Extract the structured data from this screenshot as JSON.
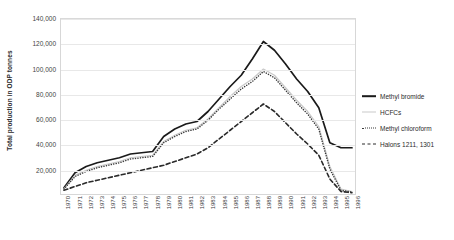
{
  "chart_data": {
    "type": "line",
    "title": "",
    "xlabel": "",
    "ylabel": "Total production in ODP tonnes",
    "ylim": [
      0,
      140000
    ],
    "ytick_labels": [
      "140,000",
      "120,000",
      "100,000",
      "80,000",
      "60,000",
      "40,000",
      "20,000"
    ],
    "ytick_values": [
      140000,
      120000,
      100000,
      80000,
      60000,
      40000,
      20000
    ],
    "grid": true,
    "legend_position": "right",
    "x": [
      1970,
      1971,
      1972,
      1973,
      1974,
      1975,
      1976,
      1977,
      1978,
      1979,
      1980,
      1981,
      1982,
      1983,
      1984,
      1985,
      1986,
      1987,
      1988,
      1989,
      1990,
      1991,
      1992,
      1993,
      1994,
      1995,
      1996
    ],
    "xtick_labels": [
      "1970",
      "1971",
      "1972",
      "1973",
      "1974",
      "1975",
      "1976",
      "1977",
      "1978",
      "1979",
      "1980",
      "1981",
      "1982",
      "1983",
      "1984",
      "1985",
      "1986",
      "1987",
      "1988",
      "1989",
      "1990",
      "1991",
      "1992",
      "1993",
      "1994",
      "1995",
      "1996"
    ],
    "series": [
      {
        "name": "Methyl bromide",
        "style": "solid",
        "color": "#1a1a1a",
        "values": [
          5000,
          17000,
          22000,
          25000,
          27000,
          29000,
          32000,
          33000,
          34000,
          46000,
          52000,
          56000,
          58000,
          66000,
          76000,
          86000,
          95000,
          108000,
          122000,
          115000,
          104000,
          92000,
          82000,
          69000,
          41000,
          37000,
          37000
        ]
      },
      {
        "name": "HCFCs",
        "style": "thin-solid",
        "color": "#c9c9c9",
        "values": [
          4000,
          15000,
          19000,
          22000,
          24000,
          26000,
          29000,
          30000,
          31000,
          42000,
          47000,
          51000,
          53000,
          60000,
          69000,
          78000,
          86000,
          92000,
          100000,
          95000,
          85000,
          75000,
          66000,
          54000,
          22000,
          4000,
          2000
        ]
      },
      {
        "name": "Methyl chloroform",
        "style": "dotted",
        "color": "#3a3a3a",
        "values": [
          4000,
          14000,
          18000,
          21000,
          23000,
          25000,
          28000,
          29000,
          30000,
          41000,
          46000,
          50000,
          52000,
          59000,
          68000,
          76000,
          84000,
          90000,
          98000,
          93000,
          83000,
          73000,
          64000,
          52000,
          20000,
          3000,
          1500
        ]
      },
      {
        "name": "Halons 1211, 1301",
        "style": "dashed",
        "color": "#2a2a2a",
        "values": [
          3000,
          6000,
          9000,
          11000,
          13000,
          15000,
          17000,
          19000,
          21000,
          23000,
          26000,
          29000,
          32000,
          37000,
          44000,
          51000,
          58000,
          65000,
          72000,
          66000,
          57000,
          48000,
          40000,
          31000,
          12000,
          2000,
          1000
        ]
      }
    ]
  },
  "legend": {
    "items": [
      {
        "label": "Methyl bromide"
      },
      {
        "label": "HCFCs"
      },
      {
        "label": "Methyl chloroform"
      },
      {
        "label": "Halons 1211, 1301"
      }
    ]
  }
}
